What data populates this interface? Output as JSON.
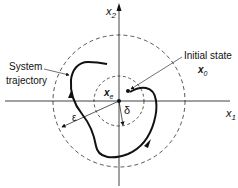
{
  "diagram": {
    "type": "phase-plane stability diagram",
    "axes": {
      "x1_label": "x",
      "x1_sub": "1",
      "x2_label": "x",
      "x2_sub": "2"
    },
    "labels": {
      "system_trajectory_line1": "System",
      "system_trajectory_line2": "trajectory",
      "initial_state": "Initial state",
      "x0_main": "x",
      "x0_sub": "0",
      "xe_main": "x",
      "xe_sub": "e",
      "epsilon": "ε",
      "delta": "δ"
    },
    "circles": [
      {
        "name": "epsilon-circle",
        "radius_px": 66,
        "style": "dashed"
      },
      {
        "name": "delta-circle",
        "radius_px": 25,
        "style": "dashed"
      }
    ],
    "colors": {
      "ink": "#111111",
      "background": "#ffffff"
    }
  }
}
